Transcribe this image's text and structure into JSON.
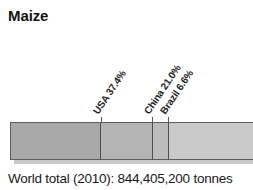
{
  "title": "Maize",
  "footer": {
    "world_total": "World total (2010): 844,405,200 tonnes"
  },
  "chart_data": {
    "type": "bar",
    "orientation": "horizontal",
    "stacked": true,
    "title": "Maize",
    "subtitle": "",
    "xlabel": "",
    "ylabel": "",
    "annotations": [
      "World total (2010): 844,405,200 tonnes"
    ],
    "grid": false,
    "legend": "none",
    "units": "percent of world total",
    "total_label": "World total (2010): 844,405,200 tonnes",
    "total_value": 844405200,
    "total_units": "tonnes",
    "year": 2010,
    "categories": [
      "USA",
      "China",
      "Brazil",
      "Rest of world"
    ],
    "values": [
      37.4,
      21.0,
      6.6,
      35.0
    ],
    "labels": [
      "USA 37.4%",
      "China 21.0%",
      "Brazil 6.6%",
      ""
    ],
    "segments": [
      {
        "name": "USA",
        "label": "USA 37.4%",
        "value": 37.4,
        "color": "#a9a9a9",
        "labeled": true
      },
      {
        "name": "China",
        "label": "China 21.0%",
        "value": 21.0,
        "color": "#b4b4b4",
        "labeled": true
      },
      {
        "name": "Brazil",
        "label": "Brazil 6.6%",
        "value": 6.6,
        "color": "#bcbcbc",
        "labeled": true
      },
      {
        "name": "Rest of world",
        "label": "",
        "value": 35.0,
        "color": "#c9c9c9",
        "labeled": false
      }
    ],
    "xlim": [
      0,
      100
    ]
  },
  "colors": {
    "segment_usa": "#a9a9a9",
    "segment_china": "#b4b4b4",
    "segment_brazil": "#bcbcbc",
    "segment_rest": "#c9c9c9",
    "shadow": "#c9c9c9",
    "outline": "#5d5d5d",
    "text": "#1a1a1a"
  }
}
